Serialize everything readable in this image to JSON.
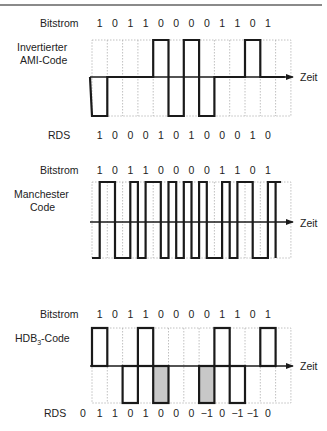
{
  "grid": {
    "left": 92,
    "col_width": 15.3,
    "columns": 13,
    "right": 291
  },
  "colors": {
    "wave": "#1a1a1a",
    "grid": "#b0b0b0",
    "hatch_fill": "#c8c8c8",
    "text": "#222222"
  },
  "panels": [
    {
      "id": "ami",
      "label_lines": [
        "Invertierter",
        "AMI-Code"
      ],
      "bitstream_label": "Bitstrom",
      "bits": [
        "1",
        "0",
        "1",
        "1",
        "0",
        "0",
        "0",
        "0",
        "1",
        "1",
        "0",
        "1"
      ],
      "levels": [
        -1,
        0,
        0,
        0,
        1,
        -1,
        1,
        -1,
        0,
        0,
        1,
        0
      ],
      "axis_label": "Zeit",
      "rds_label": "RDS",
      "rds": [
        "1",
        "0",
        "0",
        "0",
        "1",
        "0",
        "1",
        "0",
        "0",
        "0",
        "1",
        "0"
      ]
    },
    {
      "id": "manchester",
      "label_lines": [
        "Manchester",
        "Code"
      ],
      "bitstream_label": "Bitstrom",
      "bits": [
        "1",
        "0",
        "1",
        "1",
        "0",
        "0",
        "0",
        "0",
        "1",
        "1",
        "0",
        "1"
      ],
      "axis_label": "Zeit"
    },
    {
      "id": "hdb3",
      "label_main": "HDB",
      "label_sub": "3",
      "label_suffix": "-Code",
      "bitstream_label": "Bitstrom",
      "bits": [
        "1",
        "0",
        "1",
        "1",
        "0",
        "0",
        "0",
        "0",
        "1",
        "1",
        "0",
        "1"
      ],
      "levels": [
        1,
        0,
        -1,
        1,
        -1,
        0,
        0,
        -1,
        1,
        -1,
        0,
        1
      ],
      "violation_bits": [
        4,
        7
      ],
      "axis_label": "Zeit",
      "rds_label": "RDS",
      "rds_initial": "0",
      "rds": [
        "1",
        "1",
        "0",
        "1",
        "0",
        "0",
        "0",
        "−1",
        "0",
        "−1",
        "−1",
        "0"
      ]
    }
  ]
}
